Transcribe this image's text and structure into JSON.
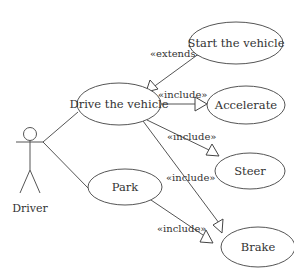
{
  "diagram": {
    "type": "use-case",
    "actor": {
      "id": "driver",
      "label": "Driver"
    },
    "use_cases": [
      {
        "id": "start",
        "label": "Start the vehicle"
      },
      {
        "id": "drive",
        "label": "Drive the vehicle"
      },
      {
        "id": "accelerate",
        "label": "Accelerate"
      },
      {
        "id": "steer",
        "label": "Steer"
      },
      {
        "id": "park",
        "label": "Park"
      },
      {
        "id": "brake",
        "label": "Brake"
      }
    ],
    "relationships": [
      {
        "from": "driver",
        "to": "drive",
        "type": "association",
        "label": ""
      },
      {
        "from": "driver",
        "to": "park",
        "type": "association",
        "label": ""
      },
      {
        "from": "start",
        "to": "drive",
        "type": "extends",
        "label": "«extends»"
      },
      {
        "from": "drive",
        "to": "accelerate",
        "type": "include",
        "label": "«include»"
      },
      {
        "from": "drive",
        "to": "steer",
        "type": "include",
        "label": "«include»"
      },
      {
        "from": "drive",
        "to": "brake",
        "type": "include",
        "label": "«include»"
      },
      {
        "from": "park",
        "to": "brake",
        "type": "include",
        "label": "«include»"
      }
    ],
    "colors": {
      "stroke": "#555555",
      "text": "#333333",
      "background": "#ffffff"
    }
  }
}
